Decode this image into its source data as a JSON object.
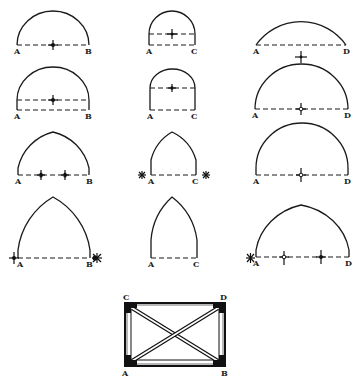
{
  "figure": {
    "rows": [
      {
        "arches": [
          {
            "id": "r1-ab",
            "type": "semicircular",
            "left_label": "A",
            "right_label": "B"
          },
          {
            "id": "r1-ac",
            "type": "stilted-semicircular",
            "left_label": "A",
            "right_label": "C"
          },
          {
            "id": "r1-ad",
            "type": "segmental",
            "left_label": "A",
            "right_label": "D"
          }
        ]
      },
      {
        "arches": [
          {
            "id": "r2-ab",
            "type": "stilted-semicircular",
            "left_label": "A",
            "right_label": "B"
          },
          {
            "id": "r2-ac",
            "type": "stilted-semicircular",
            "left_label": "A",
            "right_label": "C"
          },
          {
            "id": "r2-ad",
            "type": "semicircular",
            "left_label": "A",
            "right_label": "D"
          }
        ]
      },
      {
        "arches": [
          {
            "id": "r3-ab",
            "type": "drop-pointed",
            "left_label": "A",
            "right_label": "B"
          },
          {
            "id": "r3-ac",
            "type": "lancet",
            "left_label": "A",
            "right_label": "C"
          },
          {
            "id": "r3-ad",
            "type": "semicircular",
            "left_label": "A",
            "right_label": "D"
          }
        ]
      },
      {
        "arches": [
          {
            "id": "r4-ab",
            "type": "equilateral-pointed",
            "left_label": "A",
            "right_label": "B"
          },
          {
            "id": "r4-ac",
            "type": "lancet",
            "left_label": "A",
            "right_label": "C"
          },
          {
            "id": "r4-ad",
            "type": "drop-pointed",
            "left_label": "A",
            "right_label": "D"
          }
        ]
      }
    ],
    "plan": {
      "corner_labels": {
        "top_left": "C",
        "top_right": "D",
        "bottom_left": "A",
        "bottom_right": "B"
      }
    }
  }
}
